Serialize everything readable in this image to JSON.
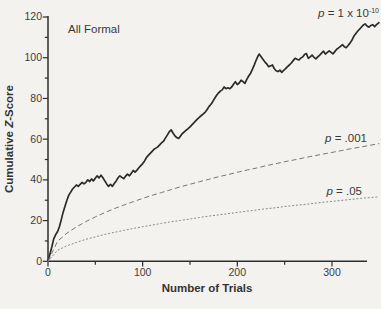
{
  "figure": {
    "annotation_all_formal": "All Formal",
    "label_p10": {
      "p": "p",
      "mid": " = 1 x 10",
      "sup": "-10"
    },
    "label_p001": {
      "p": "p",
      "mid": " = .001"
    },
    "label_p05": {
      "p": "p",
      "mid": " = .05"
    },
    "line_color": "#2b2b2b",
    "dashed_color": "#787878",
    "dotted_color": "#8a8a8a"
  },
  "chart_data": {
    "type": "line",
    "title": "",
    "xlabel": "Number of Trials",
    "ylabel_prefix": "Cumulative ",
    "ylabel_z": "Z",
    "ylabel_suffix": "-Score",
    "xlim": [
      0,
      350
    ],
    "ylim": [
      0,
      120
    ],
    "grid": false,
    "legend": "in-plot annotations next to each curve",
    "xticks_major": [
      0,
      100,
      200,
      300
    ],
    "xticks_minor": [
      50,
      150,
      250
    ],
    "yticks_major": [
      0,
      20,
      40,
      60,
      80,
      100,
      120
    ],
    "yticks_minor": [
      10,
      30,
      50,
      70,
      90,
      110
    ],
    "xtick_labels": [
      "0",
      "100",
      "200",
      "300"
    ],
    "ytick_labels": [
      "0",
      "20",
      "40",
      "60",
      "80",
      "100",
      "120"
    ],
    "series": [
      {
        "name": "cumulative-z-all-formal",
        "label": "p = 1 x 10^-10",
        "style": "solid",
        "color": "#2b2b2b",
        "points": [
          [
            0,
            0
          ],
          [
            2,
            3.5
          ],
          [
            4,
            7
          ],
          [
            6,
            11
          ],
          [
            8,
            13
          ],
          [
            10,
            14.5
          ],
          [
            12,
            17
          ],
          [
            14,
            20.5
          ],
          [
            16,
            24
          ],
          [
            18,
            27
          ],
          [
            20,
            30
          ],
          [
            22,
            32.5
          ],
          [
            24,
            34
          ],
          [
            26,
            35.5
          ],
          [
            28,
            36.5
          ],
          [
            30,
            37.5
          ],
          [
            32,
            36.8
          ],
          [
            34,
            37.8
          ],
          [
            36,
            38.8
          ],
          [
            38,
            38
          ],
          [
            40,
            38.8
          ],
          [
            42,
            40
          ],
          [
            44,
            39.2
          ],
          [
            46,
            40.5
          ],
          [
            48,
            39.5
          ],
          [
            50,
            40.8
          ],
          [
            52,
            42
          ],
          [
            54,
            41
          ],
          [
            56,
            42.3
          ],
          [
            58,
            41
          ],
          [
            60,
            39.5
          ],
          [
            62,
            38
          ],
          [
            64,
            36.8
          ],
          [
            66,
            37.8
          ],
          [
            68,
            36.8
          ],
          [
            70,
            38.2
          ],
          [
            72,
            39.5
          ],
          [
            74,
            41
          ],
          [
            76,
            42
          ],
          [
            78,
            41.2
          ],
          [
            80,
            40.6
          ],
          [
            82,
            41.8
          ],
          [
            84,
            42.8
          ],
          [
            86,
            42
          ],
          [
            88,
            43.2
          ],
          [
            90,
            44.6
          ],
          [
            92,
            43.8
          ],
          [
            94,
            44.8
          ],
          [
            96,
            46
          ],
          [
            98,
            47
          ],
          [
            100,
            48
          ],
          [
            102,
            49.3
          ],
          [
            104,
            51
          ],
          [
            106,
            52
          ],
          [
            108,
            53
          ],
          [
            110,
            54
          ],
          [
            112,
            55
          ],
          [
            114,
            55.6
          ],
          [
            116,
            56.2
          ],
          [
            118,
            57.2
          ],
          [
            120,
            58.2
          ],
          [
            122,
            59
          ],
          [
            124,
            60.5
          ],
          [
            126,
            62
          ],
          [
            128,
            63.6
          ],
          [
            130,
            64.6
          ],
          [
            132,
            63
          ],
          [
            134,
            61.6
          ],
          [
            136,
            60.8
          ],
          [
            138,
            60.3
          ],
          [
            140,
            61.5
          ],
          [
            142,
            62.8
          ],
          [
            144,
            63.6
          ],
          [
            146,
            64.4
          ],
          [
            148,
            65.2
          ],
          [
            150,
            66
          ],
          [
            152,
            67
          ],
          [
            154,
            68
          ],
          [
            156,
            69
          ],
          [
            158,
            70
          ],
          [
            160,
            70.8
          ],
          [
            162,
            71.6
          ],
          [
            164,
            72.4
          ],
          [
            166,
            73.2
          ],
          [
            168,
            74.4
          ],
          [
            170,
            76
          ],
          [
            172,
            77
          ],
          [
            174,
            78.4
          ],
          [
            176,
            80
          ],
          [
            178,
            81.4
          ],
          [
            180,
            82.6
          ],
          [
            182,
            83.6
          ],
          [
            184,
            84.2
          ],
          [
            186,
            85.6
          ],
          [
            188,
            84.8
          ],
          [
            190,
            85.2
          ],
          [
            192,
            84.8
          ],
          [
            194,
            85.6
          ],
          [
            196,
            87
          ],
          [
            198,
            88.2
          ],
          [
            200,
            86.8
          ],
          [
            202,
            87.6
          ],
          [
            204,
            89
          ],
          [
            206,
            88.2
          ],
          [
            208,
            87.4
          ],
          [
            210,
            89.4
          ],
          [
            212,
            91
          ],
          [
            214,
            92.4
          ],
          [
            216,
            94.4
          ],
          [
            218,
            96.6
          ],
          [
            220,
            99
          ],
          [
            222,
            101
          ],
          [
            223,
            101.8
          ],
          [
            225,
            100.6
          ],
          [
            227,
            99.2
          ],
          [
            229,
            98
          ],
          [
            231,
            97
          ],
          [
            233,
            95.6
          ],
          [
            235,
            96
          ],
          [
            237,
            96.4
          ],
          [
            239,
            94.6
          ],
          [
            241,
            93.6
          ],
          [
            243,
            93.2
          ],
          [
            245,
            93.9
          ],
          [
            247,
            92.8
          ],
          [
            249,
            93.8
          ],
          [
            251,
            94.6
          ],
          [
            253,
            95.6
          ],
          [
            255,
            96.4
          ],
          [
            257,
            97.4
          ],
          [
            259,
            98.6
          ],
          [
            261,
            99.7
          ],
          [
            263,
            99.2
          ],
          [
            265,
            98.9
          ],
          [
            267,
            99.8
          ],
          [
            269,
            100.4
          ],
          [
            271,
            101.6
          ],
          [
            273,
            102
          ],
          [
            275,
            99.7
          ],
          [
            277,
            100.4
          ],
          [
            279,
            101.3
          ],
          [
            281,
            100.2
          ],
          [
            283,
            99.4
          ],
          [
            285,
            100.4
          ],
          [
            287,
            101.3
          ],
          [
            289,
            102.2
          ],
          [
            291,
            103.2
          ],
          [
            293,
            101.8
          ],
          [
            295,
            102.6
          ],
          [
            297,
            103.4
          ],
          [
            299,
            102.6
          ],
          [
            301,
            101.9
          ],
          [
            303,
            103
          ],
          [
            305,
            104.2
          ],
          [
            307,
            104.8
          ],
          [
            309,
            105.6
          ],
          [
            311,
            106.4
          ],
          [
            313,
            105.4
          ],
          [
            315,
            104.9
          ],
          [
            317,
            106
          ],
          [
            319,
            107.2
          ],
          [
            321,
            108.6
          ],
          [
            323,
            110.5
          ],
          [
            325,
            111.8
          ],
          [
            327,
            113
          ],
          [
            329,
            114
          ],
          [
            331,
            115
          ],
          [
            333,
            116
          ],
          [
            335,
            116.6
          ],
          [
            337,
            115.6
          ],
          [
            339,
            115
          ],
          [
            341,
            115.8
          ],
          [
            343,
            116.2
          ],
          [
            345,
            115.3
          ],
          [
            347,
            116.2
          ],
          [
            349,
            117
          ],
          [
            350,
            117.5
          ]
        ]
      },
      {
        "name": "p001-chance-boundary",
        "label": "p = .001",
        "style": "dashed",
        "color": "#787878",
        "points": [
          [
            0,
            0
          ],
          [
            10,
            9.8
          ],
          [
            20,
            13.8
          ],
          [
            30,
            16.9
          ],
          [
            40,
            19.5
          ],
          [
            50,
            21.8
          ],
          [
            60,
            23.9
          ],
          [
            70,
            25.9
          ],
          [
            80,
            27.6
          ],
          [
            90,
            29.3
          ],
          [
            100,
            30.9
          ],
          [
            110,
            32.4
          ],
          [
            120,
            33.8
          ],
          [
            130,
            35.2
          ],
          [
            140,
            36.6
          ],
          [
            150,
            37.8
          ],
          [
            160,
            39.1
          ],
          [
            170,
            40.3
          ],
          [
            180,
            41.5
          ],
          [
            190,
            42.6
          ],
          [
            200,
            43.7
          ],
          [
            210,
            44.8
          ],
          [
            220,
            45.8
          ],
          [
            230,
            46.9
          ],
          [
            240,
            47.9
          ],
          [
            250,
            48.9
          ],
          [
            260,
            49.8
          ],
          [
            270,
            50.8
          ],
          [
            280,
            51.7
          ],
          [
            290,
            52.6
          ],
          [
            300,
            53.5
          ],
          [
            310,
            54.4
          ],
          [
            320,
            55.3
          ],
          [
            330,
            56.1
          ],
          [
            340,
            57
          ],
          [
            350,
            57.8
          ]
        ]
      },
      {
        "name": "p05-chance-boundary",
        "label": "p = .05",
        "style": "dotted",
        "color": "#8a8a8a",
        "points": [
          [
            0,
            0
          ],
          [
            10,
            5.4
          ],
          [
            20,
            7.6
          ],
          [
            30,
            9.3
          ],
          [
            40,
            10.8
          ],
          [
            50,
            12
          ],
          [
            60,
            13.2
          ],
          [
            70,
            14.2
          ],
          [
            80,
            15.2
          ],
          [
            90,
            16.1
          ],
          [
            100,
            17
          ],
          [
            110,
            17.8
          ],
          [
            120,
            18.6
          ],
          [
            130,
            19.4
          ],
          [
            140,
            20.1
          ],
          [
            150,
            20.8
          ],
          [
            160,
            21.5
          ],
          [
            170,
            22.2
          ],
          [
            180,
            22.8
          ],
          [
            190,
            23.4
          ],
          [
            200,
            24
          ],
          [
            210,
            24.6
          ],
          [
            220,
            25.2
          ],
          [
            230,
            25.8
          ],
          [
            240,
            26.3
          ],
          [
            250,
            26.9
          ],
          [
            260,
            27.4
          ],
          [
            270,
            27.9
          ],
          [
            280,
            28.4
          ],
          [
            290,
            29
          ],
          [
            300,
            29.4
          ],
          [
            310,
            29.9
          ],
          [
            320,
            30.4
          ],
          [
            330,
            30.9
          ],
          [
            340,
            31.3
          ],
          [
            350,
            31.7
          ]
        ]
      }
    ]
  }
}
